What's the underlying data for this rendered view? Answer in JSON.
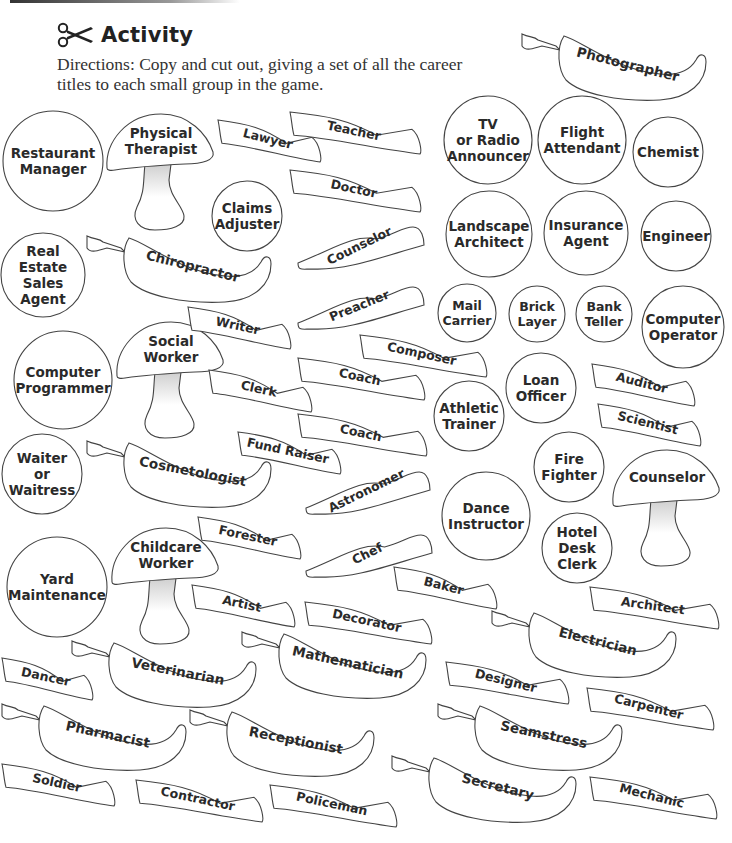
{
  "header": {
    "title": "Activity",
    "icon": "scissors-icon",
    "directions": "Directions: Copy and cut out, giving a set of all the career titles to each small group in the game."
  },
  "colors": {
    "stroke": "#444444",
    "text": "#2a2a2a",
    "stem_shade": "#cfcfcf",
    "background": "#ffffff"
  },
  "circles": [
    {
      "label": "Restaurant\nManager",
      "x": 2,
      "y": 110,
      "d": 102
    },
    {
      "label": "Claims\nAdjuster",
      "x": 211,
      "y": 180,
      "d": 72
    },
    {
      "label": "Real\nEstate\nSales\nAgent",
      "x": 0,
      "y": 232,
      "d": 86
    },
    {
      "label": "Computer\nProgrammer",
      "x": 13,
      "y": 330,
      "d": 100
    },
    {
      "label": "Waiter\nor\nWaitress",
      "x": 1,
      "y": 433,
      "d": 82
    },
    {
      "label": "Yard\nMaintenance",
      "x": 6,
      "y": 536,
      "d": 102
    },
    {
      "label": "TV\nor Radio\nAnnouncer",
      "x": 443,
      "y": 95,
      "d": 90
    },
    {
      "label": "Flight\nAttendant",
      "x": 537,
      "y": 95,
      "d": 90
    },
    {
      "label": "Chemist",
      "x": 632,
      "y": 116,
      "d": 72
    },
    {
      "label": "Landscape\nArchitect",
      "x": 445,
      "y": 190,
      "d": 88
    },
    {
      "label": "Insurance\nAgent",
      "x": 543,
      "y": 190,
      "d": 86
    },
    {
      "label": "Engineer",
      "x": 640,
      "y": 200,
      "d": 72
    },
    {
      "label": "Mail\nCarrier",
      "x": 437,
      "y": 283,
      "d": 60
    },
    {
      "label": "Brick\nLayer",
      "x": 508,
      "y": 285,
      "d": 58
    },
    {
      "label": "Bank\nTeller",
      "x": 575,
      "y": 285,
      "d": 58
    },
    {
      "label": "Computer\nOperator",
      "x": 641,
      "y": 285,
      "d": 84
    },
    {
      "label": "Loan\nOfficer",
      "x": 505,
      "y": 352,
      "d": 72
    },
    {
      "label": "Athletic\nTrainer",
      "x": 433,
      "y": 380,
      "d": 72
    },
    {
      "label": "Fire\nFighter",
      "x": 533,
      "y": 431,
      "d": 72
    },
    {
      "label": "Dance\nInstructor",
      "x": 441,
      "y": 471,
      "d": 90
    },
    {
      "label": "Hotel\nDesk\nClerk",
      "x": 541,
      "y": 512,
      "d": 72
    }
  ],
  "mushrooms": [
    {
      "label": "Physical\nTherapist",
      "x": 105,
      "y": 112
    },
    {
      "label": "Social\nWorker",
      "x": 115,
      "y": 320
    },
    {
      "label": "Childcare\nWorker",
      "x": 110,
      "y": 526
    },
    {
      "label": "Counselor",
      "x": 611,
      "y": 448
    }
  ],
  "peppers": [
    {
      "label": "Photographer",
      "x": 520,
      "y": 30,
      "rot": 14
    },
    {
      "label": "Chiropractor",
      "x": 85,
      "y": 232,
      "rot": 14
    },
    {
      "label": "Cosmetologist",
      "x": 85,
      "y": 437,
      "rot": 11
    },
    {
      "label": "Veterinarian",
      "x": 70,
      "y": 637,
      "rot": 11
    },
    {
      "label": "Mathematician",
      "x": 240,
      "y": 628,
      "rot": 12
    },
    {
      "label": "Electrician",
      "x": 490,
      "y": 607,
      "rot": 14
    },
    {
      "label": "Pharmacist",
      "x": 0,
      "y": 700,
      "rot": 12
    },
    {
      "label": "Receptionist",
      "x": 188,
      "y": 706,
      "rot": 11
    },
    {
      "label": "Seamstress",
      "x": 436,
      "y": 700,
      "rot": 12
    },
    {
      "label": "Secretary",
      "x": 390,
      "y": 752,
      "rot": 14
    }
  ],
  "ribbons": [
    {
      "label": "Lawyer",
      "x": 216,
      "y": 118,
      "w": 108,
      "rot": 14
    },
    {
      "label": "Teacher",
      "x": 288,
      "y": 110,
      "w": 136,
      "rot": 12
    },
    {
      "label": "Doctor",
      "x": 288,
      "y": 168,
      "w": 136,
      "rot": 12
    },
    {
      "label": "Counselor",
      "x": 296,
      "y": 225,
      "w": 130,
      "rot": -26
    },
    {
      "label": "Writer",
      "x": 186,
      "y": 305,
      "w": 108,
      "rot": 12
    },
    {
      "label": "Preacher",
      "x": 296,
      "y": 285,
      "w": 130,
      "rot": -22
    },
    {
      "label": "Composer",
      "x": 358,
      "y": 333,
      "w": 132,
      "rot": 12
    },
    {
      "label": "Clerk",
      "x": 207,
      "y": 368,
      "w": 108,
      "rot": 12
    },
    {
      "label": "Coach",
      "x": 296,
      "y": 356,
      "w": 132,
      "rot": 12
    },
    {
      "label": "Coach",
      "x": 296,
      "y": 412,
      "w": 134,
      "rot": 12
    },
    {
      "label": "Fund Raiser",
      "x": 236,
      "y": 430,
      "w": 108,
      "rot": 12
    },
    {
      "label": "Auditor",
      "x": 590,
      "y": 362,
      "w": 108,
      "rot": 14
    },
    {
      "label": "Scientist",
      "x": 596,
      "y": 402,
      "w": 108,
      "rot": 14
    },
    {
      "label": "Forester",
      "x": 196,
      "y": 515,
      "w": 108,
      "rot": 12
    },
    {
      "label": "Astronomer",
      "x": 304,
      "y": 470,
      "w": 128,
      "rot": -26
    },
    {
      "label": "Chef",
      "x": 304,
      "y": 533,
      "w": 130,
      "rot": -26
    },
    {
      "label": "Baker",
      "x": 392,
      "y": 565,
      "w": 108,
      "rot": 14
    },
    {
      "label": "Artist",
      "x": 190,
      "y": 583,
      "w": 108,
      "rot": 12
    },
    {
      "label": "Decorator",
      "x": 303,
      "y": 600,
      "w": 132,
      "rot": 12
    },
    {
      "label": "Architect",
      "x": 588,
      "y": 585,
      "w": 134,
      "rot": 8
    },
    {
      "label": "Dancer",
      "x": 0,
      "y": 656,
      "w": 96,
      "rot": 12
    },
    {
      "label": "Designer",
      "x": 444,
      "y": 660,
      "w": 128,
      "rot": 14
    },
    {
      "label": "Carpenter",
      "x": 585,
      "y": 686,
      "w": 132,
      "rot": 14
    },
    {
      "label": "Soldier",
      "x": 0,
      "y": 762,
      "w": 118,
      "rot": 12
    },
    {
      "label": "Contractor",
      "x": 134,
      "y": 778,
      "w": 132,
      "rot": 12
    },
    {
      "label": "Policeman",
      "x": 268,
      "y": 783,
      "w": 132,
      "rot": 12
    },
    {
      "label": "Mechanic",
      "x": 588,
      "y": 775,
      "w": 132,
      "rot": 14
    }
  ]
}
